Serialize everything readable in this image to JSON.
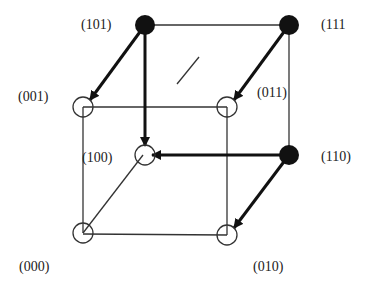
{
  "diagram": {
    "type": "boolean-cube-state-transition",
    "nodes": [
      {
        "id": "101",
        "label": "(101)",
        "filled": true,
        "x": 145,
        "y": 25
      },
      {
        "id": "111",
        "label": "(111",
        "filled": true,
        "x": 289,
        "y": 25
      },
      {
        "id": "001",
        "label": "(001)",
        "filled": false,
        "x": 83,
        "y": 107
      },
      {
        "id": "011",
        "label": "(011)",
        "filled": false,
        "x": 227,
        "y": 107
      },
      {
        "id": "100",
        "label": "(100)",
        "filled": false,
        "x": 143,
        "y": 155
      },
      {
        "id": "110",
        "label": "(110)",
        "filled": true,
        "x": 289,
        "y": 155
      },
      {
        "id": "000",
        "label": "(000)",
        "filled": false,
        "x": 83,
        "y": 233
      },
      {
        "id": "010",
        "label": "(010)",
        "filled": false,
        "x": 227,
        "y": 235
      }
    ],
    "edges": [
      {
        "from": "101",
        "to": "111"
      },
      {
        "from": "001",
        "to": "011"
      },
      {
        "from": "001",
        "to": "000"
      },
      {
        "from": "011",
        "to": "010"
      },
      {
        "from": "000",
        "to": "010"
      },
      {
        "from": "111",
        "to": "110"
      },
      {
        "from": "000",
        "to": "100"
      }
    ],
    "arrows": [
      {
        "from": "101",
        "to": "001"
      },
      {
        "from": "101",
        "to": "100"
      },
      {
        "from": "111",
        "to": "011"
      },
      {
        "from": "110",
        "to": "100"
      },
      {
        "from": "110",
        "to": "010"
      }
    ],
    "labels": {
      "n101": "(101)",
      "n111": "(111",
      "n001": "(001)",
      "n011": "(011)",
      "n100": "(100)",
      "n110": "(110)",
      "n000": "(000)",
      "n010": "(010)"
    }
  }
}
